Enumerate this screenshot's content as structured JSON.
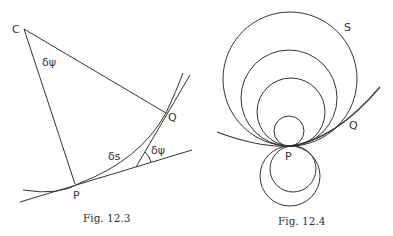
{
  "figures": [
    {
      "caption": "Fig. 12.3",
      "labels": {
        "center": "C",
        "point_p": "P",
        "point_q": "Q",
        "angle_at_c": "δψ",
        "arc_length": "δs",
        "angle_between_tangents": "δψ"
      }
    },
    {
      "caption": "Fig. 12.4",
      "labels": {
        "circle_s": "S",
        "point_p": "P",
        "point_q": "Q"
      }
    }
  ],
  "colors": {
    "stroke": "#333333",
    "background": "#ffffff"
  }
}
